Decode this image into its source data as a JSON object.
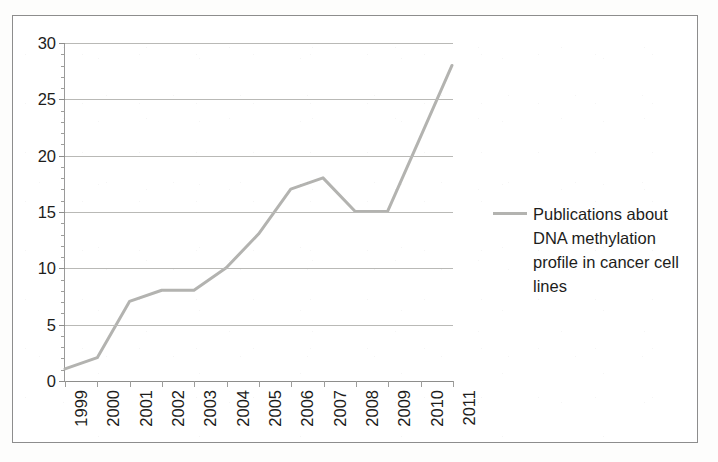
{
  "chart_data": {
    "type": "line",
    "title": "",
    "xlabel": "",
    "ylabel": "",
    "x": [
      "1999",
      "2000",
      "2001",
      "2002",
      "2003",
      "2004",
      "2005",
      "2006",
      "2007",
      "2008",
      "2009",
      "2010",
      "2011"
    ],
    "categories": [
      "1999",
      "2000",
      "2001",
      "2002",
      "2003",
      "2004",
      "2005",
      "2006",
      "2007",
      "2008",
      "2009",
      "2010",
      "2011"
    ],
    "series": [
      {
        "name": "Publications about DNA methylation profile in cancer cell lines",
        "values": [
          1,
          2,
          7,
          8,
          8,
          10,
          13,
          17,
          18,
          15,
          15,
          21.5,
          28
        ],
        "color": "#b3b3b0"
      }
    ],
    "values": [
      1,
      2,
      7,
      8,
      8,
      10,
      13,
      17,
      18,
      15,
      15,
      21.5,
      28
    ],
    "ylim": [
      0,
      30
    ],
    "yticks": [
      0,
      5,
      10,
      15,
      20,
      25,
      30
    ],
    "ytick_labels": [
      "0",
      "5",
      "10",
      "15",
      "20",
      "25",
      "30"
    ],
    "y_minor_tick_step": 1,
    "grid": true,
    "grid_axis": "y",
    "legend_position": "right",
    "xtick_label_rotation": -90
  },
  "legend": {
    "entries": [
      {
        "label": "Publications about DNA methylation profile in cancer cell lines",
        "swatch_color": "#b3b3b0",
        "marker": "line-swatch"
      }
    ]
  },
  "colors": {
    "series_line": "#b3b3b0",
    "gridline": "#b9b9b6",
    "axis": "#8e8e8c",
    "text": "#1d1d1b",
    "frame_border": "#8d8d8d",
    "background": "#ffffff"
  }
}
